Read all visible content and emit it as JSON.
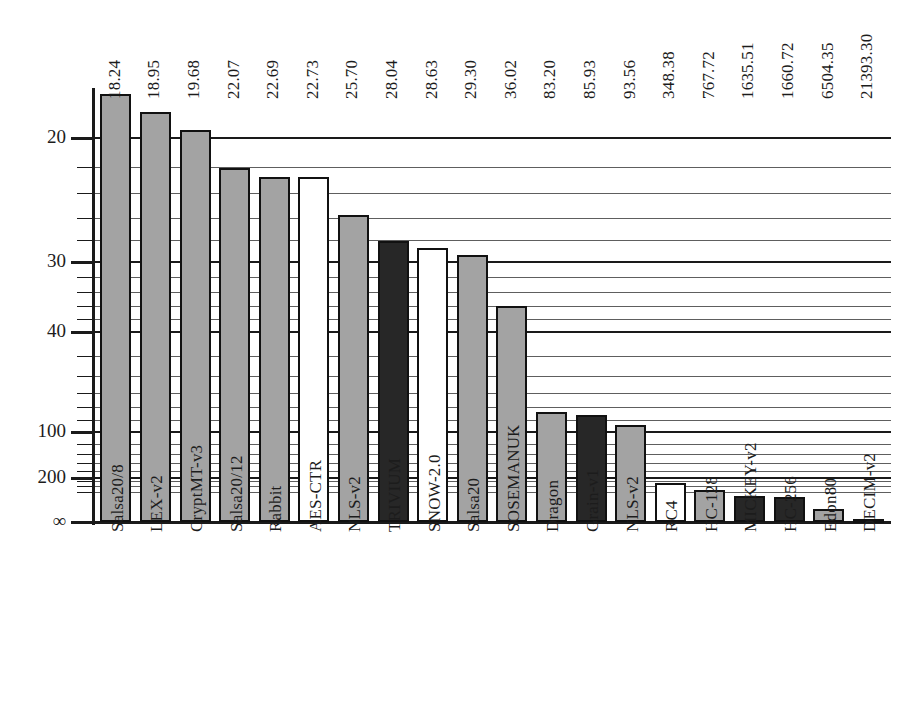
{
  "chart_data": {
    "type": "bar",
    "title": "",
    "subtitle": "",
    "xlabel": "",
    "ylabel": "",
    "scale": "log-inverted",
    "grid": true,
    "legend": false,
    "y_axis": {
      "inverted": true,
      "tick_labels": [
        "20",
        "30",
        "40",
        "100",
        "200",
        "∞"
      ],
      "tick_values": [
        20,
        30,
        40,
        100,
        200,
        99999
      ],
      "minor_ticks": [
        22,
        24,
        26,
        28,
        32,
        34,
        36,
        38,
        50,
        60,
        70,
        80,
        90,
        120,
        140,
        160,
        180,
        300,
        500,
        1000
      ],
      "range_note": "values increase downward"
    },
    "categories": [
      "Salsa20/8",
      "LEX-v2",
      "CryptMT-v3",
      "Salsa20/12",
      "Rabbit",
      "AES-CTR",
      "NLS-v2",
      "TRIVIUM",
      "SNOW-2.0",
      "Salsa20",
      "SOSEMANUK",
      "Dragon",
      "Grain-v1",
      "NLS-v2",
      "RC4",
      "HC-128",
      "MICKEY-v2",
      "HC-256",
      "Edon80",
      "DECIM-v2"
    ],
    "values": [
      18.24,
      18.95,
      19.68,
      22.07,
      22.69,
      22.73,
      25.7,
      28.04,
      28.63,
      29.3,
      36.02,
      83.2,
      85.93,
      93.56,
      348.38,
      767.72,
      1635.51,
      1660.72,
      6504.35,
      21393.3
    ],
    "value_labels": [
      "18.24",
      "18.95",
      "19.68",
      "22.07",
      "22.69",
      "22.73",
      "25.70",
      "28.04",
      "28.63",
      "29.30",
      "36.02",
      "83.20",
      "85.93",
      "93.56",
      "348.38",
      "767.72",
      "1635.51",
      "1660.72",
      "6504.35",
      "21393.30"
    ],
    "fills": [
      "gray",
      "gray",
      "gray",
      "gray",
      "gray",
      "white",
      "gray",
      "black",
      "white",
      "gray",
      "gray",
      "gray",
      "black",
      "gray",
      "white",
      "gray",
      "black",
      "black",
      "gray",
      "gray"
    ],
    "colors": {
      "gray": "#a3a3a3",
      "white": "#ffffff",
      "black": "#272727",
      "outline": "#111111",
      "grid_major": "#1a1a1a",
      "grid_minor": "#5e5e5e"
    }
  }
}
